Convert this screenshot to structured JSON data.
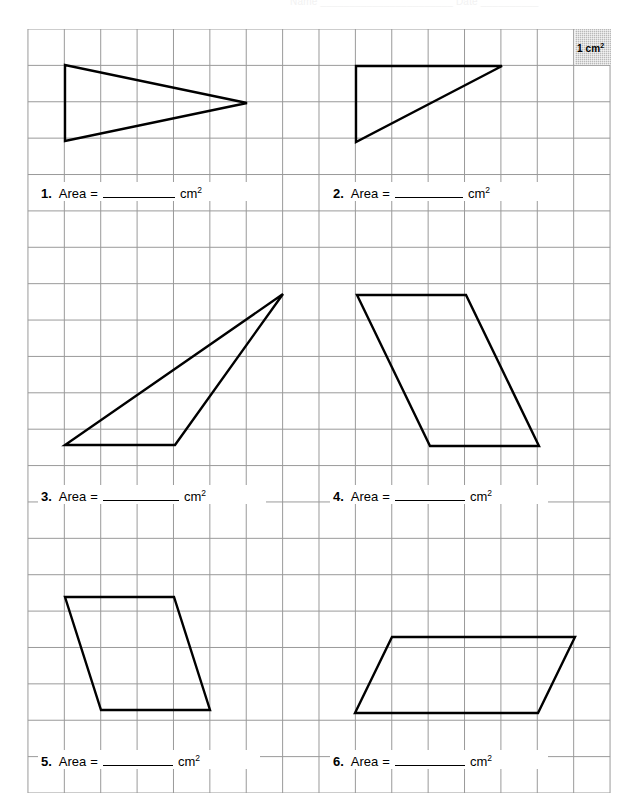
{
  "header": {
    "title": "Name _______________________  Date __________"
  },
  "legend": {
    "name": "unit-square-legend",
    "value": "1 cm",
    "exponent": "2",
    "fill_color": "#b9b9b9"
  },
  "grid": {
    "columns": 16,
    "rows": 21,
    "cell_px": 36.5,
    "origin_x": 27,
    "origin_y": 29,
    "line_color": "#9a9a9a",
    "unit_label": "1 cm²"
  },
  "problems": [
    {
      "number": "1.",
      "label": "Area",
      "equals": "=",
      "blank": "",
      "unit": "cm",
      "unit_exponent": "2",
      "shape": "triangle"
    },
    {
      "number": "2.",
      "label": "Area",
      "equals": "=",
      "blank": "",
      "unit": "cm",
      "unit_exponent": "2",
      "shape": "right-triangle"
    },
    {
      "number": "3.",
      "label": "Area",
      "equals": "=",
      "blank": "",
      "unit": "cm",
      "unit_exponent": "2",
      "shape": "triangle"
    },
    {
      "number": "4.",
      "label": "Area",
      "equals": "=",
      "blank": "",
      "unit": "cm",
      "unit_exponent": "2",
      "shape": "parallelogram"
    },
    {
      "number": "5.",
      "label": "Area",
      "equals": "=",
      "blank": "",
      "unit": "cm",
      "unit_exponent": "2",
      "shape": "parallelogram"
    },
    {
      "number": "6.",
      "label": "Area",
      "equals": "=",
      "blank": "",
      "unit": "cm",
      "unit_exponent": "2",
      "shape": "parallelogram"
    }
  ],
  "shapes": [
    {
      "id": "shape-1",
      "type": "triangle",
      "stroke": "#000000",
      "points": "65,65 65,141 247,103"
    },
    {
      "id": "shape-2",
      "type": "right-triangle",
      "stroke": "#000000",
      "points": "356,66 502,66 356,142"
    },
    {
      "id": "shape-3",
      "type": "triangle",
      "stroke": "#000000",
      "points": "65,445 175,445 283,294"
    },
    {
      "id": "shape-4",
      "type": "parallelogram",
      "stroke": "#000000",
      "points": "357,295 466,295 539,446 430,446"
    },
    {
      "id": "shape-5",
      "type": "parallelogram",
      "stroke": "#000000",
      "points": "65,597 174,597 210,710 101,710"
    },
    {
      "id": "shape-6",
      "type": "parallelogram",
      "stroke": "#000000",
      "points": "392,637 575,637 538,713 355,713"
    }
  ]
}
